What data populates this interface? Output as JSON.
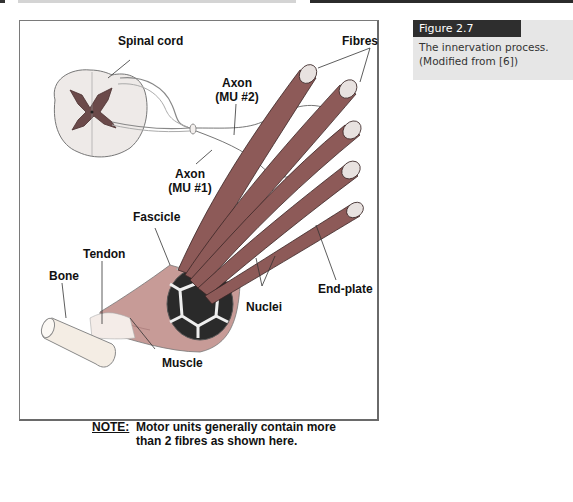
{
  "page": {
    "header_bars": [
      "left-rule",
      "right-rule"
    ]
  },
  "figure": {
    "labels": {
      "spinal_cord": "Spinal cord",
      "fibres": "Fibres",
      "axon_mu2_line1": "Axon",
      "axon_mu2_line2": "(MU #2)",
      "axon_mu1_line1": "Axon",
      "axon_mu1_line2": "(MU #1)",
      "fascicle": "Fascicle",
      "tendon": "Tendon",
      "bone": "Bone",
      "nuclei": "Nuclei",
      "end_plate": "End-plate",
      "muscle": "Muscle"
    },
    "note": {
      "label": "NOTE:",
      "line1": "Motor units generally contain more",
      "line2": "than 2 fibres as shown here."
    },
    "colors": {
      "muscle": "#b98a86",
      "fibre": "#8d5a58",
      "grey_matter": "#6b4a4a",
      "bone": "#f3ece4"
    }
  },
  "caption": {
    "title": "Figure 2.7",
    "line1": "The innervation process.",
    "line2": "(Modified from [6])"
  }
}
